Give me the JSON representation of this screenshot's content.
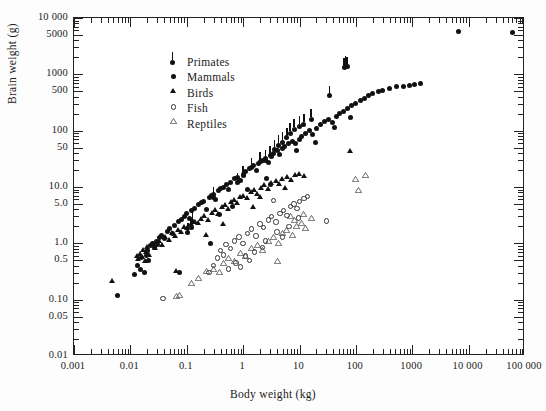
{
  "figure": {
    "title": "",
    "background_color": "#ffffff",
    "marker_color": "#111111"
  },
  "chart_data": {
    "type": "scatter",
    "title": "",
    "xlabel": "Body weight (kg)",
    "ylabel": "Brain weight (g)",
    "xscale": "log",
    "yscale": "log",
    "xlim": [
      0.001,
      100000
    ],
    "ylim": [
      0.01,
      10000
    ],
    "grid": false,
    "legend_position": "upper-left",
    "xticks": [
      {
        "value": 0.001,
        "label": "0.001"
      },
      {
        "value": 0.01,
        "label": "0.01"
      },
      {
        "value": 0.1,
        "label": "0.1"
      },
      {
        "value": 1,
        "label": "1"
      },
      {
        "value": 10,
        "label": "10"
      },
      {
        "value": 100,
        "label": "100"
      },
      {
        "value": 1000,
        "label": "1000"
      },
      {
        "value": 10000,
        "label": "10 000"
      },
      {
        "value": 100000,
        "label": "100 000"
      }
    ],
    "yticks": [
      {
        "value": 10000,
        "label": "10 000"
      },
      {
        "value": 5000,
        "label": "5000"
      },
      {
        "value": 1000,
        "label": "1000"
      },
      {
        "value": 500,
        "label": "500"
      },
      {
        "value": 100,
        "label": "100"
      },
      {
        "value": 50,
        "label": "50"
      },
      {
        "value": 10,
        "label": "10.0"
      },
      {
        "value": 5,
        "label": "5.0"
      },
      {
        "value": 1,
        "label": "1.0"
      },
      {
        "value": 0.5,
        "label": "0.5"
      },
      {
        "value": 0.1,
        "label": "0.10"
      },
      {
        "value": 0.05,
        "label": "0.05"
      },
      {
        "value": 0.01,
        "label": "0.01"
      }
    ],
    "legend": [
      {
        "name": "Primates",
        "marker": "filled-circle-with-bar"
      },
      {
        "name": "Mammals",
        "marker": "filled-circle"
      },
      {
        "name": "Birds",
        "marker": "filled-triangle"
      },
      {
        "name": "Fish",
        "marker": "open-circle"
      },
      {
        "name": "Reptiles",
        "marker": "open-triangle"
      }
    ],
    "series": [
      {
        "name": "Primates",
        "marker": "filled-circle-with-bar",
        "points": [
          [
            0.105,
            1.55
          ],
          [
            0.12,
            1.9
          ],
          [
            0.125,
            2.4
          ],
          [
            0.3,
            6.6
          ],
          [
            0.8,
            12.0
          ],
          [
            1.0,
            16.0
          ],
          [
            1.4,
            22.0
          ],
          [
            2.0,
            28.0
          ],
          [
            2.5,
            30.0
          ],
          [
            3.0,
            36.0
          ],
          [
            3.6,
            46.0
          ],
          [
            4.2,
            55.0
          ],
          [
            5.0,
            62.0
          ],
          [
            6.0,
            75.0
          ],
          [
            6.8,
            90.0
          ],
          [
            8.0,
            105.0
          ],
          [
            10.0,
            120.0
          ],
          [
            12.0,
            130.0
          ],
          [
            16.0,
            160.0
          ],
          [
            34.0,
            420.0
          ],
          [
            62.0,
            1300.0
          ],
          [
            66.0,
            1400.0
          ],
          [
            70.0,
            1350.0
          ]
        ]
      },
      {
        "name": "Mammals",
        "marker": "filled-circle",
        "points": [
          [
            0.0135,
            0.4
          ],
          [
            0.015,
            0.35
          ],
          [
            0.016,
            0.55
          ],
          [
            0.018,
            0.3
          ],
          [
            0.019,
            0.62
          ],
          [
            0.02,
            0.75
          ],
          [
            0.021,
            0.5
          ],
          [
            0.023,
            0.9
          ],
          [
            0.025,
            1.0
          ],
          [
            0.027,
            0.85
          ],
          [
            0.029,
            1.1
          ],
          [
            0.03,
            0.95
          ],
          [
            0.033,
            1.25
          ],
          [
            0.035,
            1.4
          ],
          [
            0.04,
            1.2
          ],
          [
            0.045,
            1.6
          ],
          [
            0.05,
            1.8
          ],
          [
            0.055,
            1.5
          ],
          [
            0.06,
            2.1
          ],
          [
            0.07,
            2.4
          ],
          [
            0.075,
            0.3
          ],
          [
            0.08,
            2.6
          ],
          [
            0.09,
            3.0
          ],
          [
            0.1,
            3.4
          ],
          [
            0.11,
            2.8
          ],
          [
            0.12,
            3.8
          ],
          [
            0.14,
            4.2
          ],
          [
            0.16,
            4.8
          ],
          [
            0.18,
            5.2
          ],
          [
            0.2,
            5.6
          ],
          [
            0.22,
            4.0
          ],
          [
            0.25,
            6.5
          ],
          [
            0.28,
            7.0
          ],
          [
            0.3,
            7.5
          ],
          [
            0.33,
            6.0
          ],
          [
            0.36,
            8.5
          ],
          [
            0.4,
            9.5
          ],
          [
            0.45,
            10.0
          ],
          [
            0.5,
            11.0
          ],
          [
            0.55,
            9.0
          ],
          [
            0.6,
            12.0
          ],
          [
            0.7,
            14.0
          ],
          [
            0.8,
            15.0
          ],
          [
            0.9,
            13.0
          ],
          [
            1.0,
            17.0
          ],
          [
            1.1,
            19.0
          ],
          [
            1.3,
            21.0
          ],
          [
            1.5,
            24.0
          ],
          [
            1.7,
            20.0
          ],
          [
            1.9,
            26.0
          ],
          [
            2.2,
            29.0
          ],
          [
            2.5,
            32.0
          ],
          [
            2.8,
            27.0
          ],
          [
            3.2,
            35.0
          ],
          [
            3.5,
            40.0
          ],
          [
            4.0,
            44.0
          ],
          [
            4.5,
            38.0
          ],
          [
            5.0,
            48.0
          ],
          [
            5.5,
            52.0
          ],
          [
            6.5,
            58.0
          ],
          [
            7.5,
            64.0
          ],
          [
            8.5,
            60.0
          ],
          [
            10.0,
            70.0
          ],
          [
            11.0,
            80.0
          ],
          [
            13.0,
            90.0
          ],
          [
            15.0,
            100.0
          ],
          [
            17.0,
            85.0
          ],
          [
            20.0,
            110.0
          ],
          [
            24.0,
            130.0
          ],
          [
            28.0,
            145.0
          ],
          [
            33.0,
            160.0
          ],
          [
            38.0,
            140.0
          ],
          [
            45.0,
            180.0
          ],
          [
            52.0,
            200.0
          ],
          [
            60.0,
            220.0
          ],
          [
            70.0,
            250.0
          ],
          [
            85.0,
            280.0
          ],
          [
            100.0,
            300.0
          ],
          [
            120.0,
            340.0
          ],
          [
            140.0,
            380.0
          ],
          [
            170.0,
            420.0
          ],
          [
            200.0,
            460.0
          ],
          [
            250.0,
            500.0
          ],
          [
            300.0,
            520.0
          ],
          [
            400.0,
            560.0
          ],
          [
            520.0,
            600.0
          ],
          [
            700.0,
            620.0
          ],
          [
            900.0,
            640.0
          ],
          [
            1100.0,
            660.0
          ],
          [
            1400.0,
            680.0
          ],
          [
            6600.0,
            5700.0
          ],
          [
            60000.0,
            5500.0
          ],
          [
            0.006,
            0.12
          ],
          [
            0.012,
            0.28
          ],
          [
            0.26,
            1.0
          ],
          [
            3.0,
            11.0
          ],
          [
            0.38,
            3.2
          ],
          [
            1.2,
            9.0
          ],
          [
            0.65,
            4.5
          ],
          [
            2.6,
            14.0
          ],
          [
            9.0,
            45.0
          ],
          [
            19.0,
            62.0
          ],
          [
            42.0,
            115.0
          ],
          [
            80.0,
            170.0
          ]
        ]
      },
      {
        "name": "Birds",
        "marker": "filled-triangle",
        "points": [
          [
            0.0047,
            0.2
          ],
          [
            0.013,
            0.55
          ],
          [
            0.014,
            0.48
          ],
          [
            0.015,
            0.6
          ],
          [
            0.016,
            0.52
          ],
          [
            0.017,
            0.7
          ],
          [
            0.018,
            0.45
          ],
          [
            0.019,
            0.65
          ],
          [
            0.02,
            0.8
          ],
          [
            0.022,
            0.58
          ],
          [
            0.025,
            0.9
          ],
          [
            0.028,
            0.75
          ],
          [
            0.032,
            1.0
          ],
          [
            0.036,
            0.85
          ],
          [
            0.042,
            1.2
          ],
          [
            0.048,
            1.05
          ],
          [
            0.055,
            1.4
          ],
          [
            0.062,
            1.25
          ],
          [
            0.07,
            1.6
          ],
          [
            0.08,
            1.45
          ],
          [
            0.09,
            1.8
          ],
          [
            0.1,
            1.7
          ],
          [
            0.065,
            0.3
          ],
          [
            0.12,
            2.0
          ],
          [
            0.14,
            2.2
          ],
          [
            0.16,
            2.1
          ],
          [
            0.18,
            2.5
          ],
          [
            0.2,
            2.8
          ],
          [
            0.24,
            2.4
          ],
          [
            0.28,
            3.2
          ],
          [
            0.32,
            3.6
          ],
          [
            0.36,
            3.0
          ],
          [
            0.42,
            4.0
          ],
          [
            0.48,
            4.4
          ],
          [
            0.55,
            3.8
          ],
          [
            0.62,
            5.0
          ],
          [
            0.7,
            5.5
          ],
          [
            0.8,
            4.8
          ],
          [
            0.9,
            6.0
          ],
          [
            1.0,
            6.5
          ],
          [
            1.2,
            5.8
          ],
          [
            1.4,
            7.5
          ],
          [
            1.6,
            8.0
          ],
          [
            1.8,
            7.0
          ],
          [
            2.1,
            9.0
          ],
          [
            2.4,
            10.0
          ],
          [
            2.8,
            8.5
          ],
          [
            3.2,
            11.0
          ],
          [
            3.8,
            12.0
          ],
          [
            4.4,
            10.5
          ],
          [
            5.0,
            13.0
          ],
          [
            6.0,
            14.0
          ],
          [
            7.0,
            12.5
          ],
          [
            8.5,
            15.0
          ],
          [
            10.0,
            16.0
          ],
          [
            12.0,
            14.5
          ],
          [
            80.0,
            40.0
          ],
          [
            1.5,
            4.0
          ],
          [
            0.45,
            2.0
          ],
          [
            0.22,
            1.3
          ],
          [
            2.0,
            6.0
          ],
          [
            5.5,
            9.0
          ]
        ]
      },
      {
        "name": "Fish",
        "marker": "open-circle",
        "points": [
          [
            0.038,
            0.105
          ],
          [
            0.3,
            0.4
          ],
          [
            0.35,
            0.55
          ],
          [
            0.4,
            0.75
          ],
          [
            0.45,
            0.62
          ],
          [
            0.5,
            0.95
          ],
          [
            0.6,
            0.8
          ],
          [
            0.7,
            1.1
          ],
          [
            0.85,
            1.3
          ],
          [
            1.0,
            1.0
          ],
          [
            1.2,
            1.5
          ],
          [
            1.4,
            1.8
          ],
          [
            1.7,
            1.35
          ],
          [
            2.0,
            2.2
          ],
          [
            2.3,
            1.9
          ],
          [
            2.8,
            2.6
          ],
          [
            3.2,
            3.0
          ],
          [
            3.8,
            2.4
          ],
          [
            4.5,
            3.4
          ],
          [
            5.2,
            3.8
          ],
          [
            6.0,
            3.1
          ],
          [
            7.0,
            4.5
          ],
          [
            8.0,
            5.0
          ],
          [
            9.0,
            4.2
          ],
          [
            10.0,
            5.5
          ],
          [
            12.0,
            6.2
          ],
          [
            14.0,
            6.8
          ],
          [
            3.5,
            5.8
          ],
          [
            0.55,
            0.35
          ],
          [
            0.75,
            0.45
          ],
          [
            1.1,
            0.6
          ],
          [
            1.6,
            0.7
          ],
          [
            2.2,
            0.85
          ],
          [
            0.25,
            0.3
          ],
          [
            30.0,
            2.5
          ],
          [
            4.0,
            1.6
          ],
          [
            5.0,
            1.3
          ],
          [
            6.5,
            2.0
          ],
          [
            9.5,
            2.8
          ],
          [
            2.5,
            1.1
          ],
          [
            1.3,
            0.5
          ],
          [
            0.9,
            0.38
          ]
        ]
      },
      {
        "name": "Reptiles",
        "marker": "open-triangle",
        "points": [
          [
            0.065,
            0.105
          ],
          [
            0.075,
            0.11
          ],
          [
            0.22,
            0.3
          ],
          [
            0.3,
            0.32
          ],
          [
            0.38,
            0.28
          ],
          [
            0.45,
            0.42
          ],
          [
            0.55,
            0.5
          ],
          [
            0.7,
            0.45
          ],
          [
            0.9,
            0.62
          ],
          [
            1.1,
            0.55
          ],
          [
            1.4,
            0.75
          ],
          [
            1.8,
            0.85
          ],
          [
            2.2,
            0.7
          ],
          [
            2.8,
            1.0
          ],
          [
            3.5,
            1.2
          ],
          [
            4.2,
            0.95
          ],
          [
            5.0,
            1.4
          ],
          [
            6.0,
            1.6
          ],
          [
            7.5,
            1.3
          ],
          [
            9.0,
            1.9
          ],
          [
            11.0,
            2.1
          ],
          [
            13.0,
            1.7
          ],
          [
            0.16,
            0.22
          ],
          [
            0.12,
            0.18
          ],
          [
            4.0,
            0.45
          ],
          [
            8.0,
            2.4
          ],
          [
            100.0,
            13.0
          ],
          [
            150.0,
            15.0
          ],
          [
            110.0,
            8.0
          ],
          [
            16.0,
            2.6
          ],
          [
            6.8,
            2.8
          ],
          [
            12.0,
            3.0
          ]
        ]
      }
    ]
  }
}
